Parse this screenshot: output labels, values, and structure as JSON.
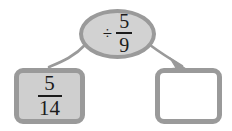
{
  "diagram": {
    "type": "fraction-division-flow",
    "background_color": "#ffffff",
    "shape_border_color": "#9a9a9a",
    "ellipse_fill_color": "#d2d2d2",
    "left_box_fill_color": "#cfcfcf",
    "right_box_fill_color": "#ffffff",
    "text_color": "#1c1c1c",
    "operator_node": {
      "label": "÷ 5/9",
      "operator_symbol": "÷",
      "fraction": {
        "numerator": "5",
        "denominator": "9"
      }
    },
    "input_box": {
      "label": "5/14",
      "fraction": {
        "numerator": "5",
        "denominator": "14"
      }
    },
    "output_box": {
      "label": "",
      "is_empty": true
    },
    "connectors": [
      {
        "name": "left-connector",
        "from": "operator-node",
        "to": "input-box",
        "has_arrowhead": false
      },
      {
        "name": "right-connector",
        "from": "operator-node",
        "to": "output-box",
        "has_arrowhead": true
      }
    ]
  }
}
